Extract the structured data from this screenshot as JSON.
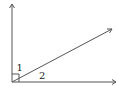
{
  "diagram": {
    "type": "angle-diagram",
    "labels": {
      "angle1": "1",
      "angle2": "2"
    },
    "colors": {
      "line": "#555555",
      "text": "#222222",
      "background": "#ffffff"
    }
  }
}
